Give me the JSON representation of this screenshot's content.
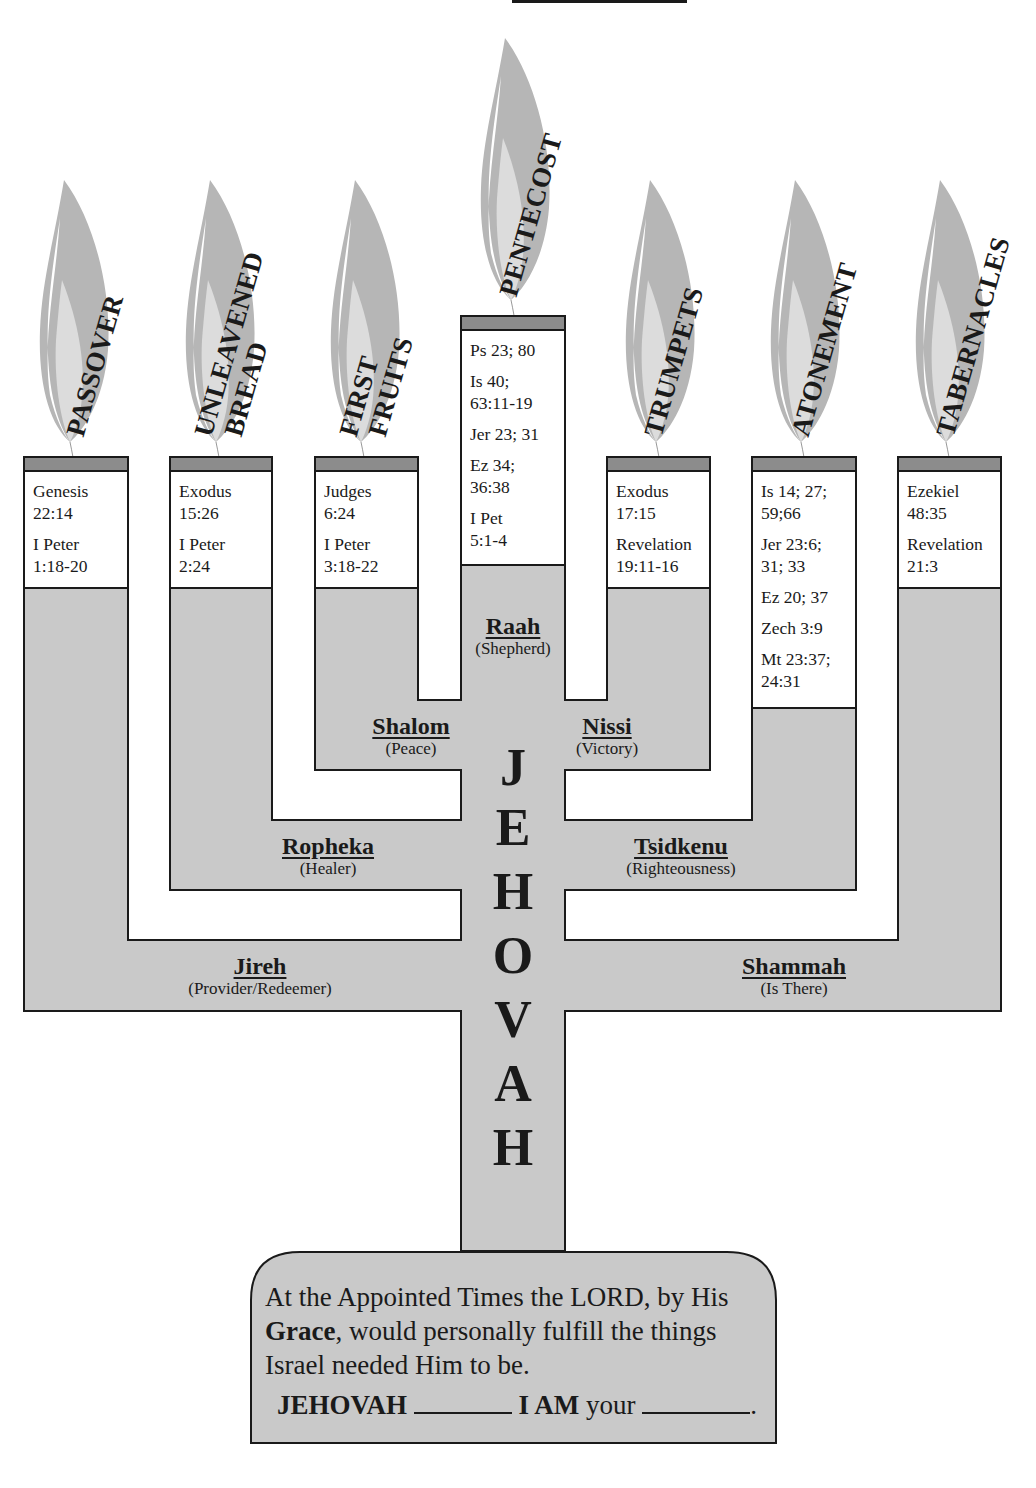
{
  "diagram": {
    "type": "menorah",
    "colors": {
      "fill": "#c9c9c9",
      "lamp_cap": "#8c8c8c",
      "flame_outer": "#b4b4b4",
      "flame_inner": "#d8d8d8",
      "stroke": "#1a1a1a",
      "background": "#ffffff"
    },
    "center_word": [
      "J",
      "E",
      "H",
      "O",
      "V",
      "A",
      "H"
    ],
    "feasts": [
      {
        "name": "PASSOVER",
        "lines": [
          "PASSOVER"
        ],
        "refs": [
          "Genesis\n22:14",
          "I Peter\n1:18-20"
        ]
      },
      {
        "name": "UNLEAVENED BREAD",
        "lines": [
          "UNLEAVENED",
          "BREAD"
        ],
        "refs": [
          "Exodus\n15:26",
          "I Peter\n2:24"
        ]
      },
      {
        "name": "FIRST FRUITS",
        "lines": [
          "FIRST",
          "FRUITS"
        ],
        "refs": [
          "Judges\n6:24",
          "I Peter\n3:18-22"
        ]
      },
      {
        "name": "PENTECOST",
        "lines": [
          "PENTECOST"
        ],
        "refs": [
          "Ps 23; 80",
          "Is 40;\n63:11-19",
          "Jer 23; 31",
          "Ez 34;\n36:38",
          "I Pet\n5:1-4"
        ]
      },
      {
        "name": "TRUMPETS",
        "lines": [
          "TRUMPETS"
        ],
        "refs": [
          "Exodus\n17:15",
          "Revelation\n19:11-16"
        ]
      },
      {
        "name": "ATONEMENT",
        "lines": [
          "ATONEMENT"
        ],
        "refs": [
          "Is 14; 27;\n59;66",
          "Jer 23:6;\n31; 33",
          "Ez 20; 37",
          "Zech 3:9",
          "Mt 23:37;\n24:31"
        ]
      },
      {
        "name": "TABERNACLES",
        "lines": [
          "TABERNACLES"
        ],
        "refs": [
          "Ezekiel\n48:35",
          "Revelation\n21:3"
        ]
      }
    ],
    "names": [
      {
        "name": "Raah",
        "meaning": "(Shepherd)"
      },
      {
        "name": "Shalom",
        "meaning": "(Peace)"
      },
      {
        "name": "Nissi",
        "meaning": "(Victory)"
      },
      {
        "name": "Ropheka",
        "meaning": "(Healer)"
      },
      {
        "name": "Tsidkenu",
        "meaning": "(Righteousness)"
      },
      {
        "name": "Jireh",
        "meaning": "(Provider/Redeemer)"
      },
      {
        "name": "Shammah",
        "meaning": "(Is There)"
      }
    ]
  },
  "note": {
    "line1": "At the Appointed Times the LORD, by His",
    "grace_word": "Grace",
    "line2_rest": ", would personally fulfill the things",
    "line3": "Israel needed Him to be.",
    "fill_in_start": "JEHOVAH",
    "fill_in_mid": "I AM",
    "fill_in_mid_rest": " your",
    "fill_in_end": "."
  }
}
